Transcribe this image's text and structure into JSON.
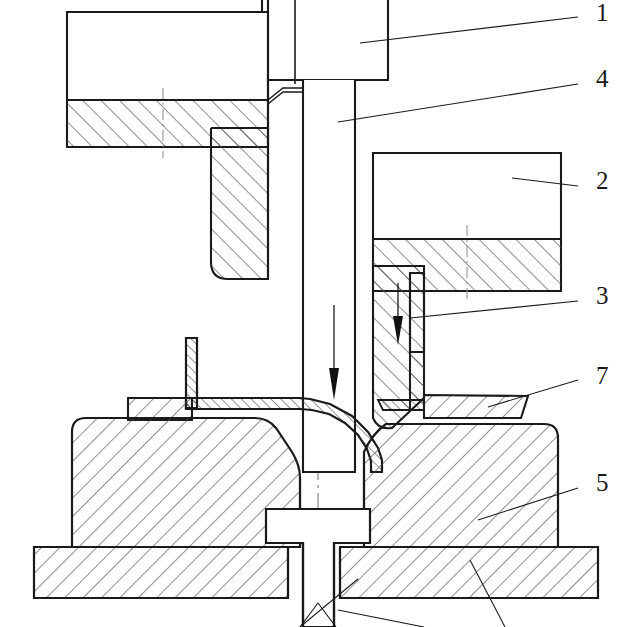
{
  "drawing": {
    "title": "Cross-section of a deep-drawing / sheet-metal forming die assembly",
    "type": "engineering-cross-section",
    "view": "half-section about vertical centerline",
    "background_color": "#ffffff",
    "line_color": "#1a1a1a",
    "hatch_color": "#4d4d4d",
    "centerline_color": "#7a7a7a"
  },
  "callouts": [
    {
      "id": "1",
      "label": "1",
      "x": 598,
      "y": 2,
      "leader_from": [
        578,
        18
      ],
      "leader_to": [
        360,
        43
      ],
      "target": "upper-punch-holder"
    },
    {
      "id": "4",
      "label": "4",
      "x": 598,
      "y": 68,
      "leader_from": [
        578,
        84
      ],
      "leader_to": [
        338,
        122
      ],
      "target": "punch"
    },
    {
      "id": "2",
      "label": "2",
      "x": 598,
      "y": 170,
      "leader_from": [
        578,
        186
      ],
      "leader_to": [
        512,
        178
      ],
      "target": "upper-right-pressure-pad"
    },
    {
      "id": "3",
      "label": "3",
      "x": 598,
      "y": 285,
      "leader_from": [
        578,
        301
      ],
      "leader_to": [
        410,
        315
      ],
      "target": "blank-holder"
    },
    {
      "id": "7",
      "label": "7",
      "x": 598,
      "y": 366,
      "leader_from": [
        578,
        380
      ],
      "leader_to": [
        490,
        406
      ],
      "target": "die-insert-ring"
    },
    {
      "id": "5",
      "label": "5",
      "x": 598,
      "y": 472,
      "leader_from": [
        578,
        488
      ],
      "leader_to": [
        480,
        520
      ],
      "target": "lower-die-block"
    },
    {
      "id": "6",
      "label": "",
      "x": 0,
      "y": 0,
      "leader_from": [
        440,
        620
      ],
      "leader_to": [
        330,
        612
      ],
      "target": "ejector-pin"
    }
  ],
  "components": {
    "upper_punch_holder": {
      "name": "Upper punch holder",
      "hatched": false
    },
    "punch": {
      "name": "Punch (descending)",
      "hatched": false,
      "motion": "down"
    },
    "upper_left_pad": {
      "name": "Upper left pressure pad",
      "hatched": true,
      "hatch_direction": "up-right"
    },
    "upper_right_pad": {
      "name": "Upper right pressure pad",
      "hatched": true,
      "hatch_direction": "up-right"
    },
    "blank_holder": {
      "name": "Blank holder",
      "hatched": true,
      "hatch_direction": "up-right",
      "motion": "down"
    },
    "sheet_blank": {
      "name": "Sheet-metal blank",
      "hatched": true,
      "thin_section": true
    },
    "die_insert_ring": {
      "name": "Die insert / ring",
      "hatched": true,
      "hatch_direction": "down-right"
    },
    "lower_die_block_left": {
      "name": "Lower die block (left)",
      "hatched": true,
      "hatch_direction": "down-right"
    },
    "lower_die_block_right": {
      "name": "Lower die block (right)",
      "hatched": true,
      "hatch_direction": "down-right"
    },
    "base_plate_left": {
      "name": "Base plate (left)",
      "hatched": true,
      "hatch_direction": "down-right"
    },
    "base_plate_right": {
      "name": "Base plate (right)",
      "hatched": true,
      "hatch_direction": "down-right"
    },
    "ejector_pin": {
      "name": "Ejector / knockout pin",
      "hatched": false
    }
  },
  "motion_arrows": [
    {
      "name": "punch-motion-arrow",
      "x": 334,
      "y_top": 305,
      "y_bottom": 400,
      "direction": "down"
    },
    {
      "name": "blank-holder-motion-arrow",
      "x": 398,
      "y_top": 283,
      "y_bottom": 345,
      "direction": "down"
    }
  ],
  "centerline": {
    "x": 318,
    "y_top": 0,
    "y_bottom": 627,
    "style": "dash-dot"
  }
}
